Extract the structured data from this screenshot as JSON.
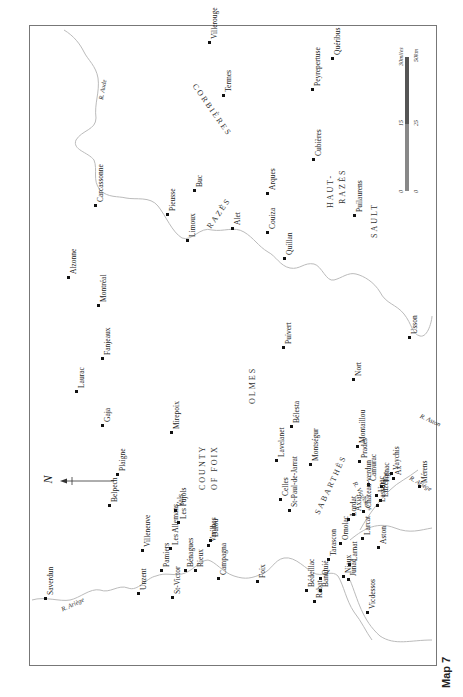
{
  "caption": "Map 7",
  "north_symbol": "N",
  "scale": {
    "miles_label": "30miles",
    "km_label": "50km",
    "miles_ticks": [
      "0",
      "15",
      "30miles"
    ],
    "km_ticks": [
      "0",
      "25",
      "50km"
    ]
  },
  "regions": [
    {
      "name": "CORBIÈRES",
      "x": 198,
      "y": 82,
      "rot": 55
    },
    {
      "name": "RAZÈS",
      "x": 205,
      "y": 225,
      "rot": -55
    },
    {
      "name": "HAUT-",
      "x": 326,
      "y": 208,
      "rot": -90
    },
    {
      "name": "RAZÈS",
      "x": 338,
      "y": 204,
      "rot": -90
    },
    {
      "name": "SAULT",
      "x": 370,
      "y": 238,
      "rot": -90
    },
    {
      "name": "OLMES",
      "x": 248,
      "y": 404,
      "rot": -90
    },
    {
      "name": "SABARTHÈS",
      "x": 313,
      "y": 512,
      "rot": -65
    },
    {
      "name": "COUNTY",
      "x": 198,
      "y": 490,
      "rot": -90
    },
    {
      "name": "OF FOIX",
      "x": 210,
      "y": 490,
      "rot": -90
    }
  ],
  "rivers": [
    {
      "name": "R. Ariège",
      "x": 60,
      "y": 606,
      "rot": -25
    },
    {
      "name": "R. Aude",
      "x": 97,
      "y": 99,
      "rot": -80
    },
    {
      "name": "R. Aston",
      "x": 422,
      "y": 412,
      "rot": 25
    },
    {
      "name": "R. Ariège",
      "x": 412,
      "y": 474,
      "rot": 30
    },
    {
      "name": "R. Vicdessos",
      "x": 358,
      "y": 480,
      "rot": 60
    }
  ],
  "places": [
    {
      "name": "Saverdun",
      "x": 45,
      "y": 598
    },
    {
      "name": "Unzent",
      "x": 138,
      "y": 593
    },
    {
      "name": "St-Victor",
      "x": 172,
      "y": 597
    },
    {
      "name": "Villeneuve",
      "x": 142,
      "y": 550
    },
    {
      "name": "Pamiers",
      "x": 161,
      "y": 570
    },
    {
      "name": "Les Allemans",
      "x": 170,
      "y": 548
    },
    {
      "name": "Bénagues",
      "x": 185,
      "y": 570
    },
    {
      "name": "Rieux",
      "x": 195,
      "y": 570
    },
    {
      "name": "Campagna",
      "x": 218,
      "y": 578
    },
    {
      "name": "Varilhes",
      "x": 208,
      "y": 545
    },
    {
      "name": "Dalou",
      "x": 210,
      "y": 540
    },
    {
      "name": "Les Pujols",
      "x": 178,
      "y": 522
    },
    {
      "name": "Vals",
      "x": 175,
      "y": 510
    },
    {
      "name": "Belpech",
      "x": 109,
      "y": 505
    },
    {
      "name": "Plaigne",
      "x": 117,
      "y": 474
    },
    {
      "name": "Gaja",
      "x": 102,
      "y": 425
    },
    {
      "name": "Laurac",
      "x": 76,
      "y": 391
    },
    {
      "name": "Mirepoix",
      "x": 171,
      "y": 432
    },
    {
      "name": "Fanjeaux",
      "x": 102,
      "y": 358
    },
    {
      "name": "Montréal",
      "x": 98,
      "y": 305
    },
    {
      "name": "Alzonne",
      "x": 68,
      "y": 277
    },
    {
      "name": "Carcassonne",
      "x": 95,
      "y": 205
    },
    {
      "name": "Pieusse",
      "x": 167,
      "y": 214
    },
    {
      "name": "Limoux",
      "x": 187,
      "y": 240
    },
    {
      "name": "Buc",
      "x": 194,
      "y": 190
    },
    {
      "name": "Alet",
      "x": 232,
      "y": 228
    },
    {
      "name": "Arques",
      "x": 267,
      "y": 193
    },
    {
      "name": "Couiza",
      "x": 267,
      "y": 232
    },
    {
      "name": "Quillan",
      "x": 284,
      "y": 258
    },
    {
      "name": "Termes",
      "x": 223,
      "y": 95
    },
    {
      "name": "Villerouge",
      "x": 209,
      "y": 42
    },
    {
      "name": "Peyrepertuse",
      "x": 312,
      "y": 89
    },
    {
      "name": "Quéribus",
      "x": 332,
      "y": 58
    },
    {
      "name": "Cubières",
      "x": 313,
      "y": 159
    },
    {
      "name": "Puilaurens",
      "x": 354,
      "y": 215
    },
    {
      "name": "Puivert",
      "x": 283,
      "y": 347
    },
    {
      "name": "Nort",
      "x": 353,
      "y": 379
    },
    {
      "name": "Usson",
      "x": 409,
      "y": 337
    },
    {
      "name": "Bélesta",
      "x": 291,
      "y": 426
    },
    {
      "name": "Lavelanet",
      "x": 276,
      "y": 460
    },
    {
      "name": "Montségur",
      "x": 310,
      "y": 464
    },
    {
      "name": "Montaillou",
      "x": 357,
      "y": 446
    },
    {
      "name": "Prades",
      "x": 359,
      "y": 461
    },
    {
      "name": "Camurac",
      "x": 368,
      "y": 484
    },
    {
      "name": "Tignac",
      "x": 381,
      "y": 486
    },
    {
      "name": "Vaychis",
      "x": 391,
      "y": 473
    },
    {
      "name": "Ax",
      "x": 393,
      "y": 478
    },
    {
      "name": "Mérens",
      "x": 419,
      "y": 486
    },
    {
      "name": "Unac",
      "x": 376,
      "y": 495
    },
    {
      "name": "Luzenac",
      "x": 380,
      "y": 500
    },
    {
      "name": "Lassur",
      "x": 377,
      "y": 505
    },
    {
      "name": "Château-verdun",
      "x": 363,
      "y": 511
    },
    {
      "name": "Axiat",
      "x": 353,
      "y": 514
    },
    {
      "name": "Lordat",
      "x": 348,
      "y": 519
    },
    {
      "name": "Celles",
      "x": 280,
      "y": 499
    },
    {
      "name": "St-Paul-de-Jarrat",
      "x": 289,
      "y": 510
    },
    {
      "name": "Foix",
      "x": 257,
      "y": 581
    },
    {
      "name": "Ornolac",
      "x": 340,
      "y": 543
    },
    {
      "name": "Tarascon",
      "x": 328,
      "y": 559
    },
    {
      "name": "Larcat",
      "x": 362,
      "y": 538
    },
    {
      "name": "Aston",
      "x": 378,
      "y": 547
    },
    {
      "name": "Larnat",
      "x": 349,
      "y": 564
    },
    {
      "name": "Niaux",
      "x": 343,
      "y": 576
    },
    {
      "name": "Junac",
      "x": 348,
      "y": 579
    },
    {
      "name": "Quié",
      "x": 320,
      "y": 578
    },
    {
      "name": "Banat",
      "x": 320,
      "y": 590
    },
    {
      "name": "Bédeillac",
      "x": 306,
      "y": 590
    },
    {
      "name": "Rabat",
      "x": 314,
      "y": 601
    },
    {
      "name": "Vicdessos",
      "x": 367,
      "y": 612
    }
  ]
}
